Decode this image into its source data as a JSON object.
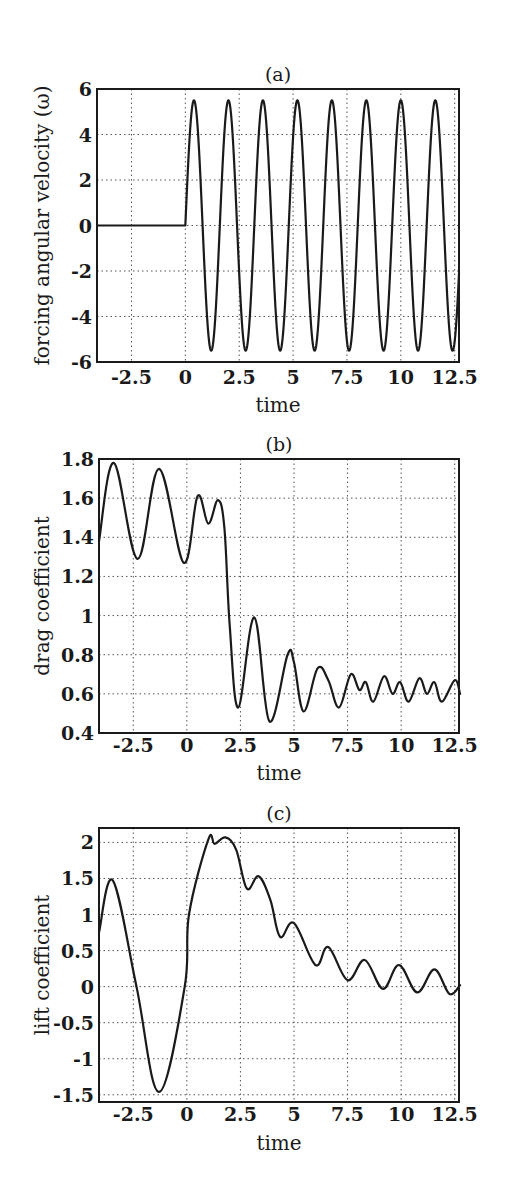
{
  "chart_data": [
    {
      "id": "a",
      "type": "line",
      "title": "(a)",
      "xlabel": "time",
      "ylabel": "forcing angular velocity (ω)",
      "xlim": [
        -4.1,
        12.7
      ],
      "ylim": [
        -6,
        6
      ],
      "xticks": [
        -2.5,
        0,
        2.5,
        5,
        7.5,
        10,
        12.5
      ],
      "xtick_labels": [
        "-2.5",
        "0",
        "2.5",
        "5",
        "7.5",
        "10",
        "12.5"
      ],
      "yticks": [
        -6,
        -4,
        -2,
        0,
        2,
        4,
        6
      ],
      "ytick_labels": [
        "-6",
        "-4",
        "-2",
        "0",
        "2",
        "4",
        "6"
      ],
      "grid": true,
      "series": [
        {
          "name": "forcing angular velocity",
          "description": "0 for t<0, then 5.5*sin(2*pi*t/1.6) for t>=0",
          "amplitude": 5.5,
          "period": 1.6,
          "x": [
            -4.1,
            0,
            0.4,
            1.2,
            2.0,
            2.8,
            3.6,
            4.4,
            5.2,
            6.0,
            6.8,
            7.6,
            8.4,
            9.2,
            10.0,
            10.8,
            11.6,
            12.4,
            12.7
          ],
          "y": [
            0,
            0,
            5.5,
            -5.5,
            5.5,
            -5.5,
            5.5,
            -5.5,
            5.5,
            -5.5,
            5.5,
            -5.5,
            5.5,
            -5.5,
            5.5,
            -5.5,
            5.5,
            -5.5,
            -2.9
          ]
        }
      ],
      "box": {
        "left": 97,
        "top": 89,
        "right": 459,
        "bottom": 362
      },
      "title_y": 81,
      "xtick_y": 384,
      "xlabel_y": 412,
      "ylabel_x": 42
    },
    {
      "id": "b",
      "type": "line",
      "title": "(b)",
      "xlabel": "time",
      "ylabel": "drag coefficient",
      "xlim": [
        -4.1,
        12.7
      ],
      "ylim": [
        0.4,
        1.8
      ],
      "xticks": [
        -2.5,
        0,
        2.5,
        5,
        7.5,
        10,
        12.5
      ],
      "xtick_labels": [
        "-2.5",
        "0",
        "2.5",
        "5",
        "7.5",
        "10",
        "12.5"
      ],
      "yticks": [
        0.4,
        0.6,
        0.8,
        1.0,
        1.2,
        1.4,
        1.6,
        1.8
      ],
      "ytick_labels": [
        "0.4",
        "0.6",
        "0.8",
        "1",
        "1.2",
        "1.4",
        "1.6",
        "1.8"
      ],
      "grid": true,
      "series": [
        {
          "name": "drag coefficient",
          "x": [
            -4.1,
            -3.4,
            -2.3,
            -1.3,
            -0.15,
            0.5,
            1.0,
            1.45,
            1.75,
            2.0,
            2.4,
            3.15,
            3.85,
            4.7,
            5.0,
            5.45,
            6.1,
            6.6,
            7.1,
            7.65,
            8.05,
            8.35,
            8.7,
            9.2,
            9.6,
            9.95,
            10.35,
            10.85,
            11.2,
            11.55,
            11.9,
            12.5,
            12.75
          ],
          "y": [
            1.38,
            1.78,
            1.29,
            1.75,
            1.27,
            1.61,
            1.47,
            1.59,
            1.45,
            0.95,
            0.53,
            0.99,
            0.46,
            0.8,
            0.76,
            0.51,
            0.73,
            0.67,
            0.53,
            0.7,
            0.62,
            0.66,
            0.56,
            0.69,
            0.6,
            0.66,
            0.56,
            0.68,
            0.6,
            0.66,
            0.56,
            0.67,
            0.6
          ]
        }
      ],
      "box": {
        "left": 99,
        "top": 459,
        "right": 459,
        "bottom": 733
      },
      "title_y": 451,
      "xtick_y": 752,
      "xlabel_y": 780,
      "ylabel_x": 42
    },
    {
      "id": "c",
      "type": "line",
      "title": "(c)",
      "xlabel": "time",
      "ylabel": "lift coefficient",
      "xlim": [
        -4.1,
        12.7
      ],
      "ylim": [
        -1.6,
        2.2
      ],
      "xticks": [
        -2.5,
        0,
        2.5,
        5,
        7.5,
        10,
        12.5
      ],
      "xtick_labels": [
        "-2.5",
        "0",
        "2.5",
        "5",
        "7.5",
        "10",
        "12.5"
      ],
      "yticks": [
        -1.5,
        -1,
        -0.5,
        0,
        0.5,
        1,
        1.5,
        2
      ],
      "ytick_labels": [
        "-1.5",
        "-1",
        "-0.5",
        "0",
        "0.5",
        "1",
        "1.5",
        "2"
      ],
      "grid": true,
      "series": [
        {
          "name": "lift coefficient",
          "x": [
            -4.1,
            -3.45,
            -2.35,
            -1.3,
            -0.1,
            0.1,
            1.0,
            1.3,
            1.8,
            2.3,
            2.8,
            3.35,
            3.9,
            4.35,
            5.0,
            6.0,
            6.6,
            7.5,
            8.3,
            9.15,
            9.9,
            10.75,
            11.55,
            12.25,
            12.75
          ],
          "y": [
            0.75,
            1.47,
            0.0,
            -1.46,
            0.0,
            1.0,
            2.04,
            1.98,
            2.07,
            1.9,
            1.36,
            1.53,
            1.2,
            0.69,
            0.88,
            0.3,
            0.55,
            0.09,
            0.37,
            -0.03,
            0.3,
            -0.08,
            0.24,
            -0.1,
            0.02
          ]
        }
      ],
      "box": {
        "left": 99,
        "top": 828,
        "right": 459,
        "bottom": 1102
      },
      "title_y": 820,
      "xtick_y": 1121,
      "xlabel_y": 1150,
      "ylabel_x": 42
    }
  ]
}
